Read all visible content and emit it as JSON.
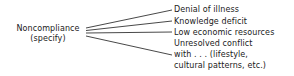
{
  "diagram": {
    "root": {
      "line1": "Noncompliance",
      "line2": "(specify)"
    },
    "branches": [
      {
        "label": "Denial of illness"
      },
      {
        "label": "Knowledge deficit"
      },
      {
        "label": "Low economic resources"
      },
      {
        "label": "Unresolved conflict",
        "continuation": [
          "with . . . (lifestyle,",
          "cultural patterns, etc.)"
        ]
      }
    ],
    "colors": {
      "text": "#1a1a1a",
      "line": "#333333",
      "background": "#ffffff"
    }
  }
}
